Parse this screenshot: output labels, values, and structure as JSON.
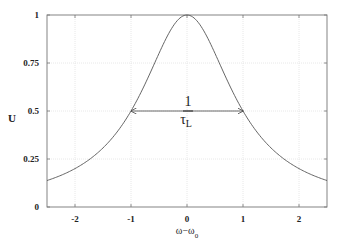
{
  "chart_data": {
    "type": "line",
    "title": "",
    "xlabel": "ω−ω₀",
    "xlabel_main": "ω−ω",
    "xlabel_sub": "0",
    "ylabel": "U",
    "xlim": [
      -2.5,
      2.5
    ],
    "ylim": [
      0,
      1
    ],
    "xticks": [
      -2,
      -1,
      0,
      1,
      2
    ],
    "xtick_labels": [
      "-2",
      "-1",
      "0",
      "1",
      "2"
    ],
    "yticks": [
      0,
      0.25,
      0.5,
      0.75,
      1
    ],
    "ytick_labels": [
      "0",
      "0.25",
      "0.5",
      "0.75",
      "1"
    ],
    "grid": true,
    "legend": null,
    "series": [
      {
        "name": "Lorentzian U = 1/(1+(ω−ω₀)²)",
        "x": [
          -2.5,
          -2.0,
          -1.5,
          -1.0,
          -0.5,
          0.0,
          0.5,
          1.0,
          1.5,
          2.0,
          2.5
        ],
        "y": [
          0.138,
          0.2,
          0.308,
          0.5,
          0.8,
          1.0,
          0.8,
          0.5,
          0.308,
          0.2,
          0.138
        ]
      }
    ],
    "annotations": [
      {
        "type": "double-arrow",
        "from": [
          -1,
          0.5
        ],
        "to": [
          1,
          0.5
        ],
        "label_numerator": "1",
        "label_denominator": "τ",
        "label_denominator_sub": "L"
      }
    ]
  }
}
